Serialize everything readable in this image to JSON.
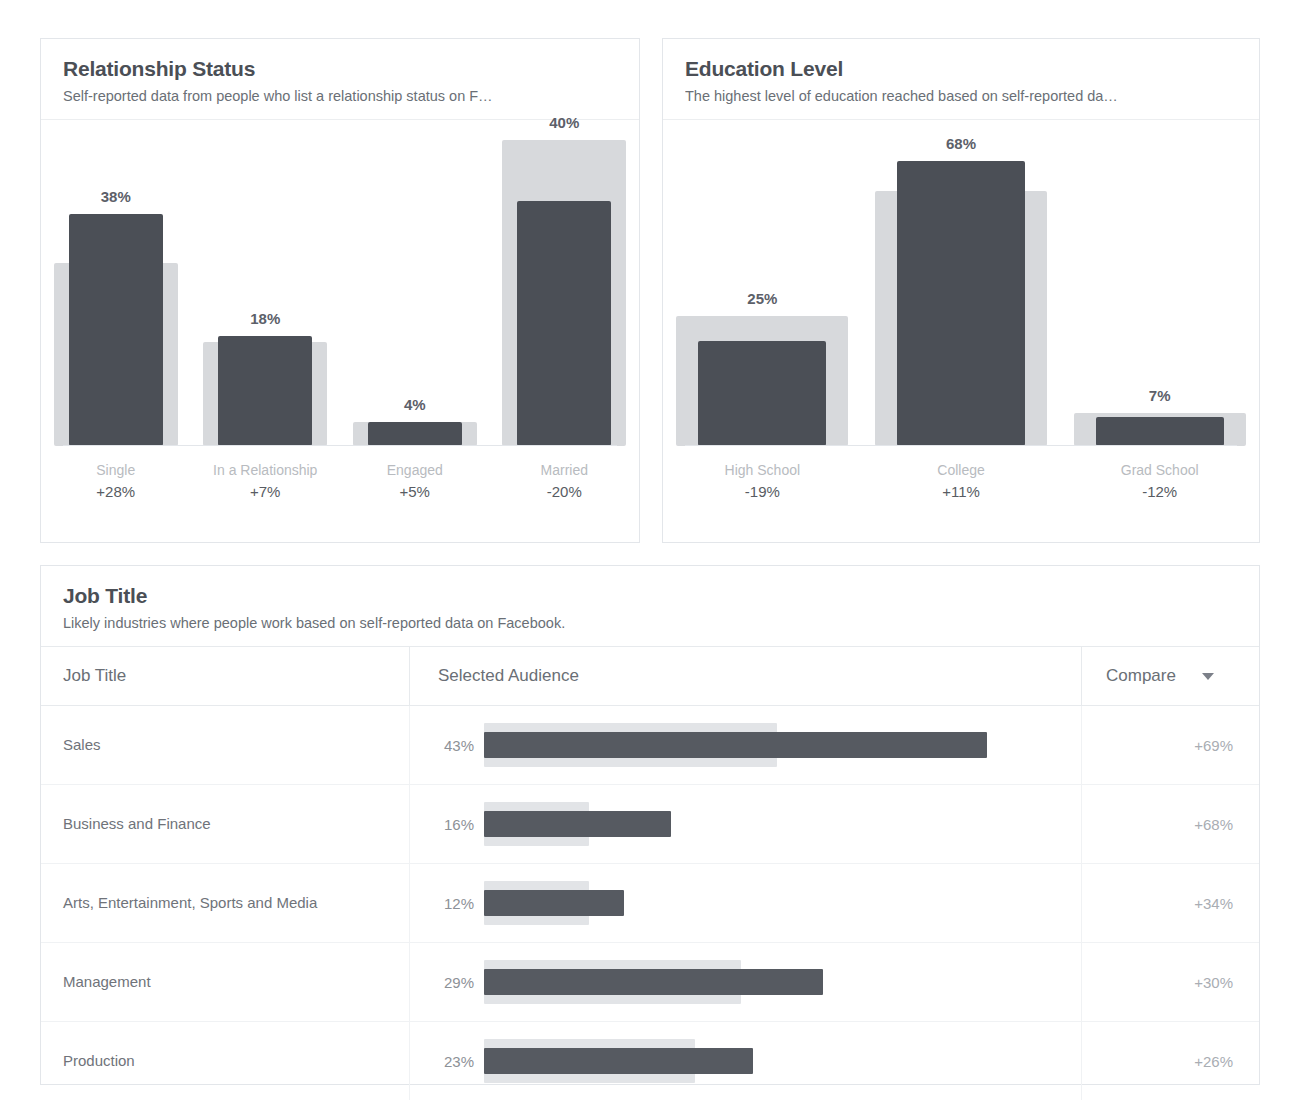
{
  "top_sliver": "............................................",
  "colors": {
    "selected_bar": "#4b4f56",
    "compare_bar": "#d7d9dc",
    "card_border": "#e3e6ea",
    "title_text": "#4b4f56",
    "muted_text": "#a9adb3"
  },
  "cards": {
    "relationship": {
      "title": "Relationship Status",
      "subtitle": "Self-reported data from people who list a relationship status on F…"
    },
    "education": {
      "title": "Education Level",
      "subtitle": "The highest level of education reached based on self-reported da…"
    },
    "job_title": {
      "title": "Job Title",
      "subtitle": "Likely industries where people work based on self-reported data on Facebook."
    }
  },
  "table": {
    "headers": {
      "job_title": "Job Title",
      "selected_audience": "Selected Audience",
      "compare": "Compare"
    },
    "sort_icon": "caret-down-icon",
    "rows": [
      {
        "job_title": "Sales",
        "selected_pct_label": "43%",
        "selected_pct": 43,
        "compare_pct": 25,
        "compare_label": "+69%"
      },
      {
        "job_title": "Business and Finance",
        "selected_pct_label": "16%",
        "selected_pct": 16,
        "compare_pct": 9,
        "compare_label": "+68%"
      },
      {
        "job_title": "Arts, Entertainment, Sports and Media",
        "selected_pct_label": "12%",
        "selected_pct": 12,
        "compare_pct": 9,
        "compare_label": "+34%"
      },
      {
        "job_title": "Management",
        "selected_pct_label": "29%",
        "selected_pct": 29,
        "compare_pct": 22,
        "compare_label": "+30%"
      },
      {
        "job_title": "Production",
        "selected_pct_label": "23%",
        "selected_pct": 23,
        "compare_pct": 18,
        "compare_label": "+26%"
      }
    ]
  },
  "chart_data": [
    {
      "type": "bar",
      "id": "relationship-status",
      "title": "Relationship Status",
      "subtitle": "Self-reported data from people who list a relationship status on F…",
      "xlabel": "",
      "ylabel": "",
      "ylim": [
        0,
        52
      ],
      "grid": false,
      "legend": "none",
      "categories": [
        "Single",
        "In a Relationship",
        "Engaged",
        "Married"
      ],
      "value_labels": [
        "38%",
        "18%",
        "4%",
        "40%"
      ],
      "compare_labels": [
        "+28%",
        "+7%",
        "+5%",
        "-20%"
      ],
      "series": [
        {
          "name": "Selected Audience",
          "values": [
            38,
            18,
            4,
            40
          ]
        },
        {
          "name": "Compare (All Facebook)",
          "values": [
            30,
            17,
            4,
            50
          ]
        }
      ]
    },
    {
      "type": "bar",
      "id": "education-level",
      "title": "Education Level",
      "subtitle": "The highest level of education reached based on self-reported da…",
      "xlabel": "",
      "ylabel": "",
      "ylim": [
        0,
        76
      ],
      "grid": false,
      "legend": "none",
      "categories": [
        "High School",
        "College",
        "Grad School"
      ],
      "value_labels": [
        "25%",
        "68%",
        "7%"
      ],
      "compare_labels": [
        "-19%",
        "+11%",
        "-12%"
      ],
      "series": [
        {
          "name": "Selected Audience",
          "values": [
            25,
            68,
            7
          ]
        },
        {
          "name": "Compare (All Facebook)",
          "values": [
            31,
            61,
            8
          ]
        }
      ]
    },
    {
      "type": "bar",
      "id": "job-title",
      "title": "Job Title",
      "subtitle": "Likely industries where people work based on self-reported data on Facebook.",
      "orientation": "horizontal",
      "xlabel": "",
      "ylabel": "",
      "xlim": [
        0,
        50
      ],
      "grid": false,
      "legend": "none",
      "categories": [
        "Sales",
        "Business and Finance",
        "Arts, Entertainment, Sports and Media",
        "Management",
        "Production"
      ],
      "value_labels": [
        "43%",
        "16%",
        "12%",
        "29%",
        "23%"
      ],
      "compare_labels": [
        "+69%",
        "+68%",
        "+34%",
        "+30%",
        "+26%"
      ],
      "series": [
        {
          "name": "Selected Audience",
          "values": [
            43,
            16,
            12,
            29,
            23
          ]
        },
        {
          "name": "Compare (All Facebook)",
          "values": [
            25,
            9,
            9,
            22,
            18
          ]
        }
      ]
    }
  ]
}
